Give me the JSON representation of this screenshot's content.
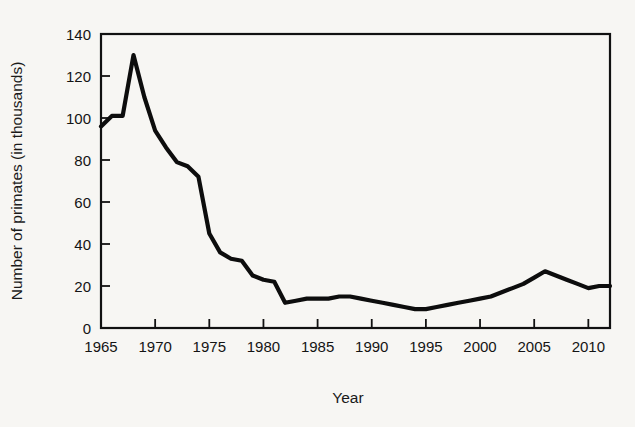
{
  "figure": {
    "background_color": "#f7f6f3",
    "line_color": "#0d0d0d",
    "axis_color": "#111111"
  },
  "chart_data": {
    "type": "line",
    "title": "",
    "xlabel": "Year",
    "ylabel": "Number of primates (in thousands)",
    "xlim": [
      1965,
      2012
    ],
    "ylim": [
      0,
      140
    ],
    "grid": false,
    "legend": null,
    "xticks": [
      1965,
      1970,
      1975,
      1980,
      1985,
      1990,
      1995,
      2000,
      2005,
      2010
    ],
    "xtick_labels": [
      "1965",
      "1970",
      "1975",
      "1980",
      "1985",
      "1990",
      "1995",
      "2000",
      "2005",
      "2010"
    ],
    "yticks": [
      0,
      20,
      40,
      60,
      80,
      100,
      120,
      140
    ],
    "ytick_labels": [
      "0",
      "20",
      "40",
      "60",
      "80",
      "100",
      "120",
      "140"
    ],
    "series": [
      {
        "name": "Number of primates",
        "x": [
          1965,
          1966,
          1967,
          1968,
          1969,
          1970,
          1971,
          1972,
          1973,
          1974,
          1975,
          1976,
          1977,
          1978,
          1979,
          1980,
          1981,
          1982,
          1983,
          1984,
          1985,
          1986,
          1987,
          1988,
          1989,
          1990,
          1991,
          1992,
          1993,
          1994,
          1995,
          1996,
          1997,
          1998,
          1999,
          2000,
          2001,
          2002,
          2003,
          2004,
          2005,
          2006,
          2007,
          2008,
          2009,
          2010,
          2011,
          2012
        ],
        "y": [
          96,
          101,
          101,
          130,
          110,
          94,
          86,
          79,
          77,
          72,
          45,
          36,
          33,
          32,
          25,
          23,
          22,
          12,
          13,
          14,
          14,
          14,
          15,
          15,
          14,
          13,
          12,
          11,
          10,
          9,
          9,
          10,
          11,
          12,
          13,
          14,
          15,
          17,
          19,
          21,
          24,
          27,
          25,
          23,
          21,
          19,
          20,
          20
        ]
      }
    ]
  },
  "axes": {
    "x_title": "Year",
    "y_title": "Number of primates (in thousands)"
  }
}
